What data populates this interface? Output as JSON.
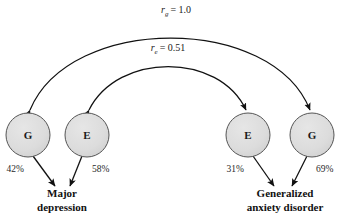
{
  "diagram": {
    "type": "path-diagram",
    "nodes": [
      {
        "id": "md-g",
        "letter": "G",
        "cx": 28,
        "cy": 135,
        "r": 22,
        "fill": "#dcdcdc",
        "stroke": "#555555"
      },
      {
        "id": "md-e",
        "letter": "E",
        "cx": 87,
        "cy": 135,
        "r": 22,
        "fill": "#dcdcdc",
        "stroke": "#555555"
      },
      {
        "id": "gad-e",
        "letter": "E",
        "cx": 248,
        "cy": 135,
        "r": 22,
        "fill": "#dcdcdc",
        "stroke": "#555555"
      },
      {
        "id": "gad-g",
        "letter": "G",
        "cx": 312,
        "cy": 135,
        "r": 22,
        "fill": "#dcdcdc",
        "stroke": "#555555"
      }
    ],
    "correlations": [
      {
        "id": "rg",
        "symbol": "r",
        "subscript": "g",
        "equals": "=",
        "value": "1.0",
        "label_x": 176,
        "label_y": 13
      },
      {
        "id": "re",
        "symbol": "r",
        "subscript": "e",
        "equals": "=",
        "value": "0.51",
        "label_x": 168,
        "label_y": 51
      }
    ],
    "paths": [
      {
        "id": "md-g-path",
        "percent": "42%",
        "x": 24,
        "y": 172,
        "anchor": "end"
      },
      {
        "id": "md-e-path",
        "percent": "58%",
        "x": 92,
        "y": 172,
        "anchor": "start"
      },
      {
        "id": "gad-e-path",
        "percent": "31%",
        "x": 244,
        "y": 172,
        "anchor": "end"
      },
      {
        "id": "gad-g-path",
        "percent": "69%",
        "x": 316,
        "y": 172,
        "anchor": "start"
      }
    ],
    "outcomes": [
      {
        "id": "major-depression",
        "line1": "Major",
        "line2": "depression",
        "cx": 62,
        "y1": 197,
        "y2": 211
      },
      {
        "id": "generalized-anxiety-disorder",
        "line1": "Generalized",
        "line2": "anxiety disorder",
        "cx": 285,
        "y1": 197,
        "y2": 211
      }
    ],
    "colors": {
      "node_fill": "#dcdcdc",
      "node_stroke": "#555555",
      "arrow": "#111111",
      "text": "#111111",
      "background": "#ffffff"
    }
  }
}
